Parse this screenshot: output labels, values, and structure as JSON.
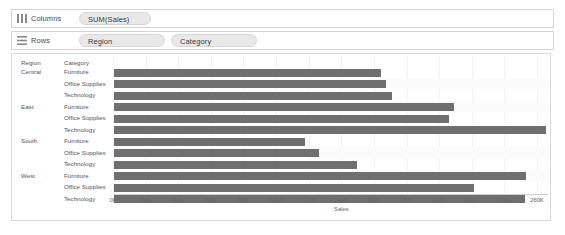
{
  "shelves": [
    {
      "icon": "columns-shelf-icon",
      "label": "Columns",
      "pills": [
        "SUM(Sales)"
      ]
    },
    {
      "icon": "rows-shelf-icon",
      "label": "Rows",
      "pills": [
        "Region",
        "Category"
      ]
    }
  ],
  "headers": {
    "region": "Region",
    "category": "Category"
  },
  "chart_data": {
    "type": "bar",
    "orientation": "horizontal",
    "title": "",
    "xlabel": "Sales",
    "ylabel": "",
    "xlim": [
      0,
      268000
    ],
    "grid": true,
    "legend": false,
    "bar_color": "#6f6f6f",
    "tick_labels": [
      "0K",
      "20K",
      "40K",
      "60K",
      "80K",
      "100K",
      "120K",
      "140K",
      "160K",
      "180K",
      "200K",
      "220K",
      "240K",
      "260K"
    ],
    "tick_values": [
      0,
      20000,
      40000,
      60000,
      80000,
      100000,
      120000,
      140000,
      160000,
      180000,
      200000,
      220000,
      240000,
      260000
    ],
    "groups": [
      {
        "region": "Central",
        "categories": [
          "Furniture",
          "Office Supplies",
          "Technology"
        ],
        "values": [
          163797,
          167026,
          170416
        ]
      },
      {
        "region": "East",
        "categories": [
          "Furniture",
          "Office Supplies",
          "Technology"
        ],
        "values": [
          208291,
          205516,
          264974
        ]
      },
      {
        "region": "South",
        "categories": [
          "Furniture",
          "Office Supplies",
          "Technology"
        ],
        "values": [
          117299,
          125651,
          148772
        ]
      },
      {
        "region": "West",
        "categories": [
          "Furniture",
          "Office Supplies",
          "Technology"
        ],
        "values": [
          252613,
          220853,
          251992
        ]
      }
    ]
  }
}
